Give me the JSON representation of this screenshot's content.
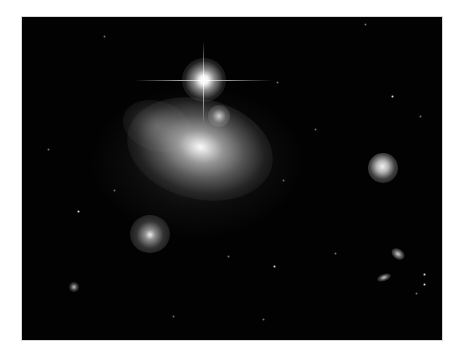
{
  "image": {
    "subject": "astronomical field with interacting galaxies and a bright foreground star",
    "background_color": "#020202",
    "page_background": "#ffffff",
    "objects": [
      {
        "type": "star",
        "name": "bright-foreground-star",
        "x": 203,
        "y": 80,
        "diffraction_spikes": true
      },
      {
        "type": "galaxy",
        "name": "main-interacting-galaxy",
        "x": 194,
        "y": 143
      },
      {
        "type": "galaxy-nucleus",
        "name": "secondary-nucleus",
        "x": 216,
        "y": 113
      },
      {
        "type": "galaxy",
        "name": "right-compact-galaxy",
        "x": 382,
        "y": 167
      },
      {
        "type": "galaxy",
        "name": "lower-left-galaxy",
        "x": 149,
        "y": 233
      },
      {
        "type": "galaxy",
        "name": "small-galaxy-lower-right-1",
        "x": 397,
        "y": 254
      },
      {
        "type": "galaxy",
        "name": "small-galaxy-lower-right-2",
        "x": 384,
        "y": 278
      },
      {
        "type": "galaxy",
        "name": "small-galaxy-lower-left",
        "x": 73,
        "y": 286
      }
    ]
  }
}
